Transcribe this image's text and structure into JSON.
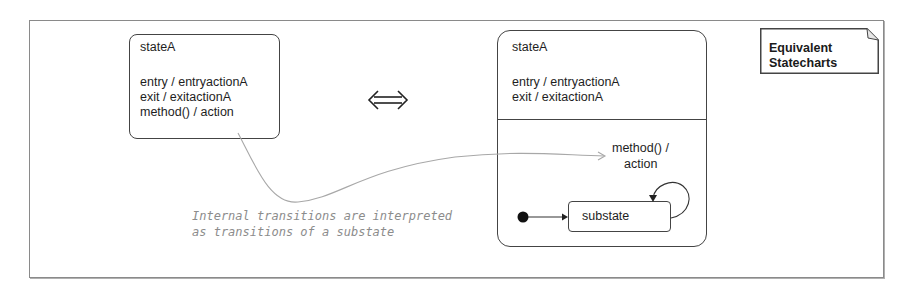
{
  "note": {
    "line1": "Equivalent",
    "line2": "Statecharts"
  },
  "left_state": {
    "name": "stateA",
    "entry": "entry / entryactionA",
    "exit": "exit / exitactionA",
    "internal": "method() / action"
  },
  "equivalence_symbol": "⇔",
  "right_state": {
    "name": "stateA",
    "entry": "entry / entryactionA",
    "exit": "exit / exitactionA",
    "transition_label_line1": "method() /",
    "transition_label_line2": "action",
    "substate": "substate"
  },
  "annotation": {
    "line1": "Internal transitions are interpreted",
    "line2": "as transitions of a substate"
  }
}
